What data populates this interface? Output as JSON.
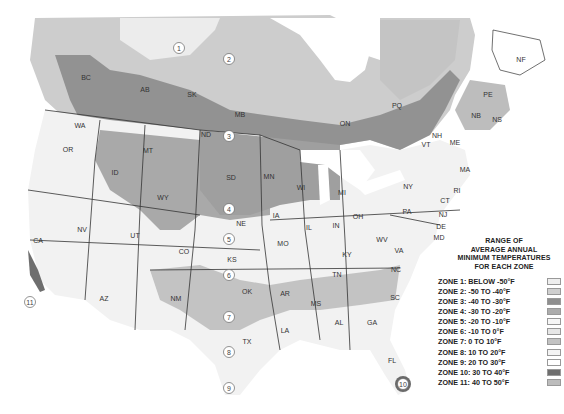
{
  "legend": {
    "title_lines": [
      "RANGE OF",
      "AVERAGE ANNUAL",
      "MINIMUM TEMPERATURES",
      "FOR EACH ZONE"
    ],
    "zones": [
      {
        "label": "ZONE 1: BELOW -50°F",
        "color": "#eeeeee"
      },
      {
        "label": "ZONE 2: -50 TO -40°F",
        "color": "#cfcfcf"
      },
      {
        "label": "ZONE 3: -40 TO -30°F",
        "color": "#8f8f8f"
      },
      {
        "label": "ZONE 4: -30 TO -20°F",
        "color": "#acacac"
      },
      {
        "label": "ZONE 5: -20 TO -10°F",
        "color": "#f6f6f6"
      },
      {
        "label": "ZONE 6: -10 TO 0°F",
        "color": "#e6e6e6"
      },
      {
        "label": "ZONE 7: 0 TO 10°F",
        "color": "#c2c2c2"
      },
      {
        "label": "ZONE 8: 10 TO 20°F",
        "color": "#f3f3f3"
      },
      {
        "label": "ZONE 9: 20 TO 30°F",
        "color": "#ffffff"
      },
      {
        "label": "ZONE 10: 30 TO 40°F",
        "color": "#6e6e6e"
      },
      {
        "label": "ZONE 11: 40 TO 50°F",
        "color": "#bcbcbc"
      }
    ]
  },
  "map": {
    "region_labels": [
      {
        "text": "BC",
        "x": 86,
        "y": 80
      },
      {
        "text": "AB",
        "x": 145,
        "y": 92
      },
      {
        "text": "SK",
        "x": 192,
        "y": 97
      },
      {
        "text": "MB",
        "x": 240,
        "y": 117
      },
      {
        "text": "ON",
        "x": 345,
        "y": 126
      },
      {
        "text": "PQ",
        "x": 397,
        "y": 108
      },
      {
        "text": "NF",
        "x": 521,
        "y": 62
      },
      {
        "text": "PE",
        "x": 488,
        "y": 97
      },
      {
        "text": "NB",
        "x": 476,
        "y": 118
      },
      {
        "text": "NS",
        "x": 497,
        "y": 122
      },
      {
        "text": "VT",
        "x": 426,
        "y": 147
      },
      {
        "text": "NH",
        "x": 437,
        "y": 138
      },
      {
        "text": "ME",
        "x": 455,
        "y": 145
      },
      {
        "text": "MA",
        "x": 465,
        "y": 172
      },
      {
        "text": "RI",
        "x": 457,
        "y": 193
      },
      {
        "text": "CT",
        "x": 445,
        "y": 203
      },
      {
        "text": "NJ",
        "x": 443,
        "y": 217
      },
      {
        "text": "DE",
        "x": 441,
        "y": 229
      },
      {
        "text": "MD",
        "x": 439,
        "y": 240
      },
      {
        "text": "NY",
        "x": 408,
        "y": 189
      },
      {
        "text": "PA",
        "x": 407,
        "y": 214
      },
      {
        "text": "WA",
        "x": 80,
        "y": 128
      },
      {
        "text": "OR",
        "x": 68,
        "y": 152
      },
      {
        "text": "ID",
        "x": 115,
        "y": 175
      },
      {
        "text": "MT",
        "x": 148,
        "y": 153
      },
      {
        "text": "WY",
        "x": 163,
        "y": 200
      },
      {
        "text": "NV",
        "x": 82,
        "y": 232
      },
      {
        "text": "CA",
        "x": 38,
        "y": 243
      },
      {
        "text": "UT",
        "x": 135,
        "y": 238
      },
      {
        "text": "CO",
        "x": 184,
        "y": 254
      },
      {
        "text": "AZ",
        "x": 104,
        "y": 301
      },
      {
        "text": "NM",
        "x": 176,
        "y": 301
      },
      {
        "text": "ND",
        "x": 206,
        "y": 137
      },
      {
        "text": "SD",
        "x": 231,
        "y": 180
      },
      {
        "text": "NE",
        "x": 241,
        "y": 226
      },
      {
        "text": "KS",
        "x": 232,
        "y": 262
      },
      {
        "text": "OK",
        "x": 247,
        "y": 294
      },
      {
        "text": "TX",
        "x": 247,
        "y": 344
      },
      {
        "text": "MN",
        "x": 269,
        "y": 179
      },
      {
        "text": "IA",
        "x": 276,
        "y": 218
      },
      {
        "text": "MO",
        "x": 283,
        "y": 246
      },
      {
        "text": "AR",
        "x": 285,
        "y": 296
      },
      {
        "text": "LA",
        "x": 285,
        "y": 333
      },
      {
        "text": "WI",
        "x": 301,
        "y": 190
      },
      {
        "text": "IL",
        "x": 309,
        "y": 230
      },
      {
        "text": "MI",
        "x": 342,
        "y": 195
      },
      {
        "text": "IN",
        "x": 336,
        "y": 228
      },
      {
        "text": "OH",
        "x": 358,
        "y": 219
      },
      {
        "text": "KY",
        "x": 347,
        "y": 257
      },
      {
        "text": "TN",
        "x": 337,
        "y": 277
      },
      {
        "text": "MS",
        "x": 316,
        "y": 306
      },
      {
        "text": "AL",
        "x": 339,
        "y": 325
      },
      {
        "text": "GA",
        "x": 372,
        "y": 325
      },
      {
        "text": "SC",
        "x": 395,
        "y": 300
      },
      {
        "text": "NC",
        "x": 396,
        "y": 272
      },
      {
        "text": "VA",
        "x": 399,
        "y": 253
      },
      {
        "text": "WV",
        "x": 382,
        "y": 242
      },
      {
        "text": "FL",
        "x": 392,
        "y": 363
      }
    ],
    "zone_markers": [
      {
        "text": "1",
        "x": 179,
        "y": 48
      },
      {
        "text": "2",
        "x": 229,
        "y": 59
      },
      {
        "text": "3",
        "x": 229,
        "y": 136
      },
      {
        "text": "4",
        "x": 229,
        "y": 209
      },
      {
        "text": "5",
        "x": 229,
        "y": 239
      },
      {
        "text": "6",
        "x": 229,
        "y": 275
      },
      {
        "text": "7",
        "x": 229,
        "y": 317
      },
      {
        "text": "8",
        "x": 229,
        "y": 352
      },
      {
        "text": "9",
        "x": 229,
        "y": 388
      },
      {
        "text": "10",
        "x": 403,
        "y": 384
      },
      {
        "text": "11",
        "x": 30,
        "y": 302
      }
    ]
  }
}
